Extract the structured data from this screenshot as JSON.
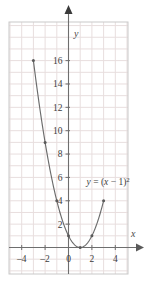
{
  "chart_data": {
    "type": "line",
    "title": "",
    "subtitle": "",
    "xlabel": "x",
    "ylabel": "y",
    "xlim": [
      -4.8,
      4.8
    ],
    "ylim": [
      -1.3,
      17.4
    ],
    "grid": true,
    "grid_step_x": 1,
    "grid_step_y": 1,
    "legend": "none",
    "annotations": [
      {
        "name": "equation-label",
        "text": "y = (x − 1)²",
        "text_plain_parts": {
          "lhs": "y",
          "equals": "=",
          "open_paren": "(",
          "variable": "x",
          "minus": "−",
          "one": "1",
          "close_paren": ")",
          "exponent": "2"
        },
        "x": 1.55,
        "y": 5.6
      }
    ],
    "xticks": [
      -4,
      -2,
      0,
      2,
      4
    ],
    "xtick_labels": [
      "–4",
      "–2",
      "0",
      "2",
      "4"
    ],
    "yticks": [
      2,
      4,
      6,
      8,
      10,
      12,
      14,
      16
    ],
    "ytick_labels": [
      "2",
      "4",
      "6",
      "8",
      "10",
      "12",
      "14",
      "16"
    ],
    "series": [
      {
        "name": "y = (x - 1)^2",
        "marker": "dot",
        "x": [
          -3,
          -2,
          -1,
          0,
          1,
          2,
          3
        ],
        "values": [
          16,
          9,
          4,
          1,
          0,
          1,
          4
        ],
        "points": [
          {
            "x": -3,
            "y": 16
          },
          {
            "x": -2,
            "y": 9
          },
          {
            "x": -1,
            "y": 4
          },
          {
            "x": 0,
            "y": 1
          },
          {
            "x": 1,
            "y": 0
          },
          {
            "x": 2,
            "y": 1
          },
          {
            "x": 3,
            "y": 4
          }
        ]
      }
    ]
  },
  "style": {
    "curve_color": "#6b6b6b",
    "point_color": "#5a5a5a",
    "axis_color": "#6e6e6e",
    "grid_color": "#e8dede",
    "frame_color": "#c9c9c9",
    "background": "#ffffff",
    "tick_text_color": "#3c3c3c"
  },
  "axes": {
    "x_axis_name": "x",
    "y_axis_name": "y",
    "x_arrow": "right-arrowhead",
    "y_arrow": "up-arrowhead"
  }
}
